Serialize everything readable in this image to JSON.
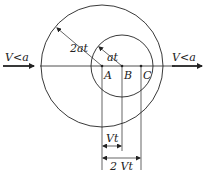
{
  "diagram": {
    "left_arrow_label": "V<a",
    "right_arrow_label": "V<a",
    "large_radius_label": "2at",
    "small_radius_label": "at",
    "points": [
      {
        "label": "A"
      },
      {
        "label": "B"
      },
      {
        "label": "C"
      }
    ],
    "dim_short_label": "Vt",
    "dim_long_label": "2 Vt"
  },
  "colors": {
    "stroke": "#222222",
    "background": "#ffffff"
  }
}
